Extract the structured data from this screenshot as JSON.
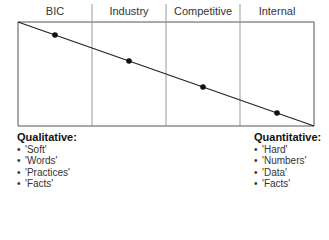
{
  "columns": [
    {
      "label": "BIC"
    },
    {
      "label": "Industry"
    },
    {
      "label": "Competitive"
    },
    {
      "label": "Internal"
    }
  ],
  "qualitative": {
    "title": "Qualitative:",
    "items": [
      "'Soft'",
      "'Words'",
      "'Practices'",
      "'Facts'"
    ]
  },
  "quantitative": {
    "title": "Quantitative:",
    "items": [
      "'Hard'",
      "'Numbers'",
      "'Data'",
      "'Facts'"
    ]
  },
  "colors": {
    "line": "#333333",
    "divider": "#888888",
    "dot": "#111111"
  }
}
